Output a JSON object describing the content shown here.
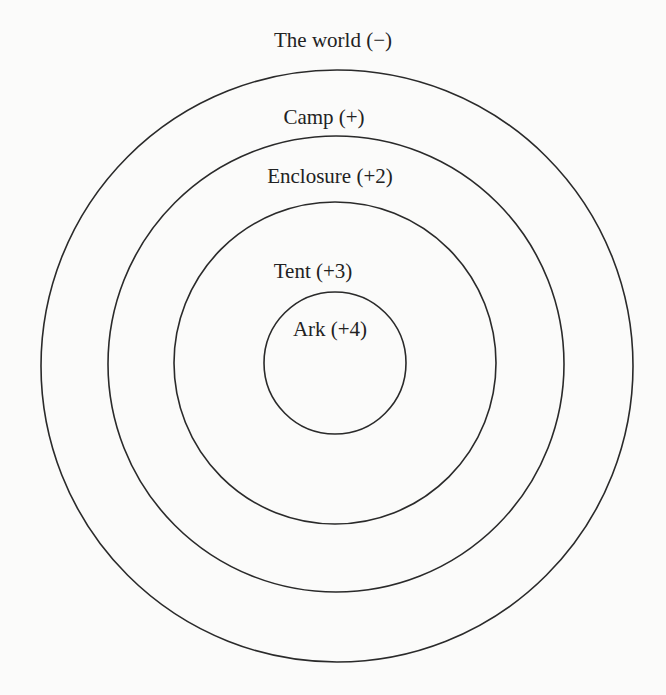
{
  "diagram": {
    "type": "concentric-circles",
    "stroke_color": "#2a2a2a",
    "background": "#fbfbfa",
    "rings": [
      {
        "label": "The world (−)",
        "level": "−"
      },
      {
        "label": "Camp (+)",
        "level": "+"
      },
      {
        "label": "Enclosure (+2)",
        "level": "+2"
      },
      {
        "label": "Tent (+3)",
        "level": "+3"
      },
      {
        "label": "Ark (+4)",
        "level": "+4"
      }
    ]
  }
}
